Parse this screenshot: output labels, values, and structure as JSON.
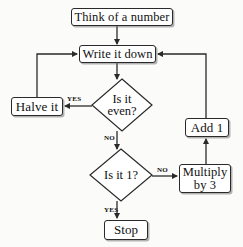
{
  "diagram": {
    "type": "flowchart",
    "background_color": "#fbfbfa",
    "line_color": "#2a2a2a",
    "text_color": "#111111",
    "nodes": [
      {
        "id": "think",
        "label": "Think of a number",
        "shape": "rounded-rect"
      },
      {
        "id": "write",
        "label": "Write it down",
        "shape": "rounded-rect"
      },
      {
        "id": "even",
        "label": "Is it\neven?",
        "shape": "diamond"
      },
      {
        "id": "halve",
        "label": "Halve it",
        "shape": "rounded-rect"
      },
      {
        "id": "one",
        "label": "Is it 1?",
        "shape": "diamond"
      },
      {
        "id": "mult",
        "label": "Multiply\nby 3",
        "shape": "rounded-rect"
      },
      {
        "id": "add",
        "label": "Add 1",
        "shape": "rounded-rect"
      },
      {
        "id": "stop",
        "label": "Stop",
        "shape": "rounded-rect"
      }
    ],
    "edge_labels": {
      "even_yes": "YES",
      "even_no": "NO",
      "one_no": "NO",
      "one_yes": "YES"
    },
    "edges": [
      {
        "from": "think",
        "to": "write",
        "label": ""
      },
      {
        "from": "write",
        "to": "even",
        "label": ""
      },
      {
        "from": "even",
        "to": "halve",
        "label": "YES"
      },
      {
        "from": "halve",
        "to": "write",
        "label": ""
      },
      {
        "from": "even",
        "to": "one",
        "label": "NO"
      },
      {
        "from": "one",
        "to": "mult",
        "label": "NO"
      },
      {
        "from": "mult",
        "to": "add",
        "label": ""
      },
      {
        "from": "add",
        "to": "write",
        "label": ""
      },
      {
        "from": "one",
        "to": "stop",
        "label": "YES"
      }
    ]
  }
}
